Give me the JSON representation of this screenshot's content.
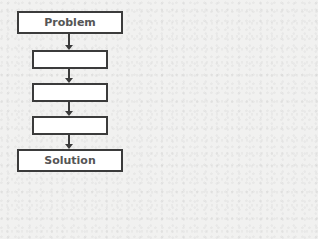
{
  "diagram": {
    "type": "flowchart",
    "direction": "top-to-bottom",
    "nodes": [
      {
        "id": "problem",
        "label": "Problem"
      },
      {
        "id": "step1",
        "label": ""
      },
      {
        "id": "step2",
        "label": ""
      },
      {
        "id": "step3",
        "label": ""
      },
      {
        "id": "solution",
        "label": "Solution"
      }
    ],
    "edges": [
      {
        "from": "problem",
        "to": "step1"
      },
      {
        "from": "step1",
        "to": "step2"
      },
      {
        "from": "step2",
        "to": "step3"
      },
      {
        "from": "step3",
        "to": "solution"
      }
    ],
    "colors": {
      "stroke": "#3b3b3b",
      "text": "#555555",
      "fill": "#ffffff",
      "background": "#f1f1f0"
    }
  }
}
